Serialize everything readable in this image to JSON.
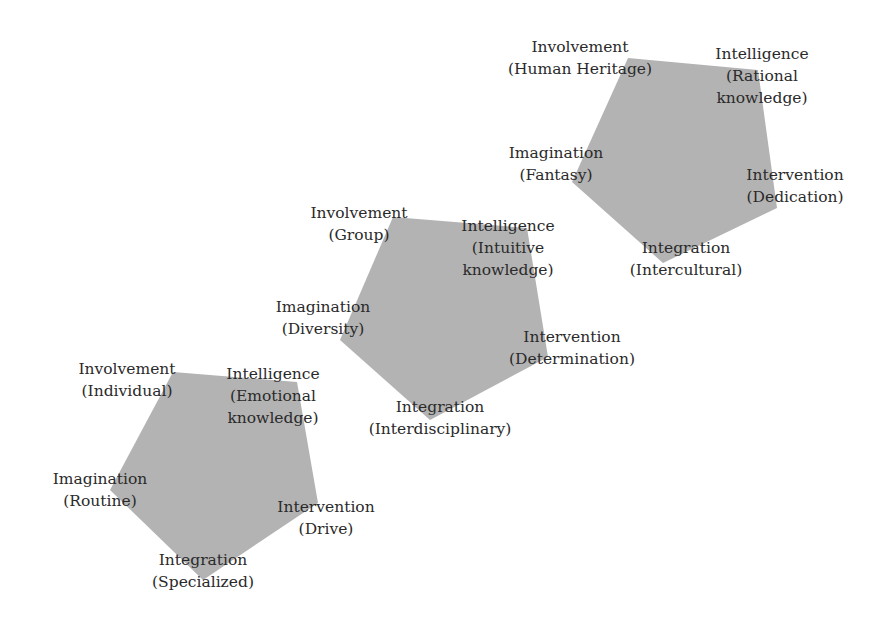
{
  "diagram": {
    "fill_color": "#b3b3b3",
    "text_color": "#2a2a2a",
    "pentagons": [
      {
        "id": "individual-level",
        "points": "173,372 297,382 318,503 203,580 110,490",
        "labels": {
          "involvement": {
            "title": "Involvement",
            "sub": "(Individual)"
          },
          "intelligence": {
            "title": "Intelligence",
            "sub": "(Emotional",
            "sub2": "knowledge)"
          },
          "imagination": {
            "title": "Imagination",
            "sub": "(Routine)"
          },
          "intervention": {
            "title": "Intervention",
            "sub": "(Drive)"
          },
          "integration": {
            "title": "Integration",
            "sub": "(Specialized)"
          }
        }
      },
      {
        "id": "group-level",
        "points": "393,217 527,228 548,357 430,420 340,340",
        "labels": {
          "involvement": {
            "title": "Involvement",
            "sub": "(Group)"
          },
          "intelligence": {
            "title": "Intelligence",
            "sub": "(Intuitive",
            "sub2": "knowledge)"
          },
          "imagination": {
            "title": "Imagination",
            "sub": "(Diversity)"
          },
          "intervention": {
            "title": "Intervention",
            "sub": "(Determination)"
          },
          "integration": {
            "title": "Integration",
            "sub": "(Interdisciplinary)"
          }
        }
      },
      {
        "id": "heritage-level",
        "points": "628,58 758,70 777,208 663,263 572,182",
        "labels": {
          "involvement": {
            "title": "Involvement",
            "sub": "(Human Heritage)"
          },
          "intelligence": {
            "title": "Intelligence",
            "sub": "(Rational",
            "sub2": "knowledge)"
          },
          "imagination": {
            "title": "Imagination",
            "sub": "(Fantasy)"
          },
          "intervention": {
            "title": "Intervention",
            "sub": "(Dedication)"
          },
          "integration": {
            "title": "Integration",
            "sub": "(Intercultural)"
          }
        }
      }
    ]
  }
}
